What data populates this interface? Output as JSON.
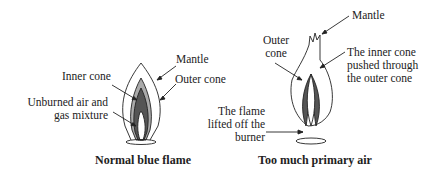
{
  "left_diagram": {
    "caption": "Normal blue flame",
    "labels": {
      "mantle": "Mantle",
      "inner_cone": "Inner cone",
      "outer_cone": "Outer cone",
      "unburned_1": "Unburned air and",
      "unburned_2": "gas mixture"
    }
  },
  "right_diagram": {
    "caption": "Too much primary air",
    "labels": {
      "mantle": "Mantle",
      "outer_cone_1": "Outer",
      "outer_cone_2": "cone",
      "inner_pushed_1": "The inner cone",
      "inner_pushed_2": "pushed through",
      "inner_pushed_3": "the outer cone",
      "lifted_1": "The flame",
      "lifted_2": "lifted off the",
      "lifted_3": "burner"
    }
  },
  "colors": {
    "ink": "#222222",
    "inner_fill": "#555555",
    "mid_fill": "#aaaaaa"
  }
}
